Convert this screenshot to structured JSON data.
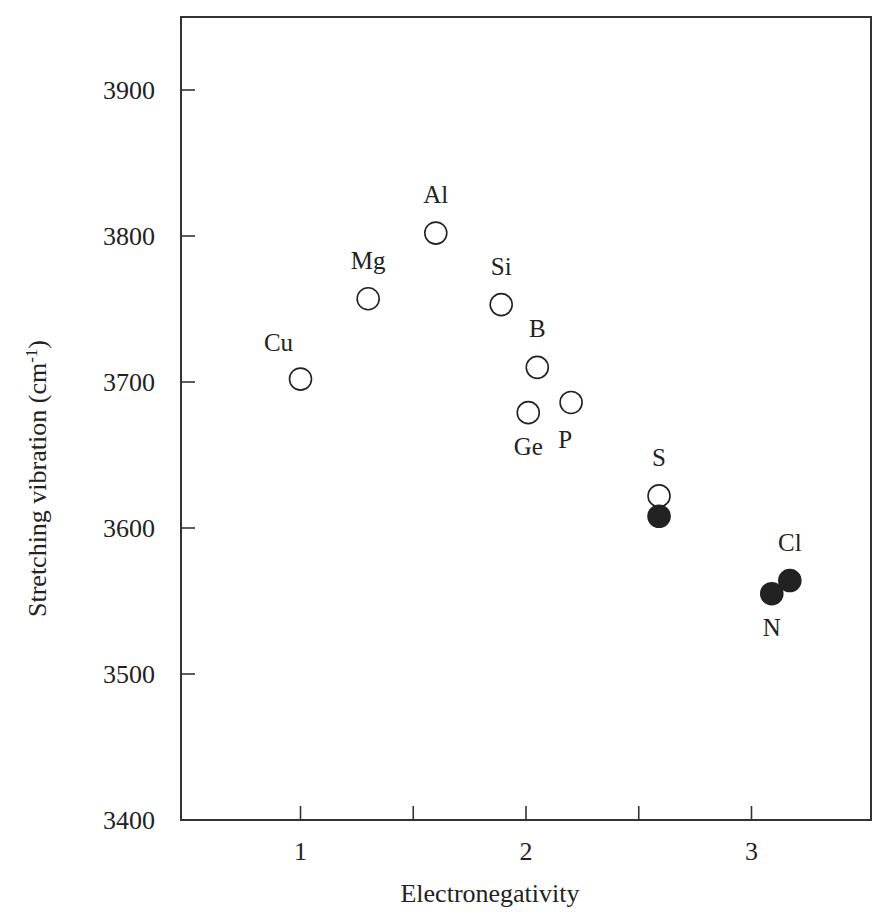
{
  "chart_data": {
    "type": "scatter",
    "title": "",
    "xlabel": "Electronegativity",
    "ylabel": "Stretching vibration (cm",
    "ylabel_superscript": "-1",
    "ylabel_suffix": ")",
    "xlim": [
      0.47,
      3.53
    ],
    "ylim": [
      3400,
      3950
    ],
    "x_ticks": [
      1,
      2,
      3
    ],
    "x_tick_labels": [
      "1",
      "2",
      "3"
    ],
    "x_minor_ticks": [
      1.5,
      2.5
    ],
    "y_ticks": [
      3400,
      3500,
      3600,
      3700,
      3800,
      3900
    ],
    "y_tick_labels": [
      "3400",
      "3500",
      "3600",
      "3700",
      "3800",
      "3900"
    ],
    "grid": false,
    "legend": null,
    "series": [
      {
        "name": "open",
        "marker": "open-circle",
        "points": [
          {
            "label": "Cu",
            "x": 1.0,
            "y": 3702,
            "label_pos": "above-left"
          },
          {
            "label": "Mg",
            "x": 1.3,
            "y": 3757,
            "label_pos": "above"
          },
          {
            "label": "Al",
            "x": 1.6,
            "y": 3802,
            "label_pos": "above"
          },
          {
            "label": "Si",
            "x": 1.89,
            "y": 3753,
            "label_pos": "above"
          },
          {
            "label": "B",
            "x": 2.05,
            "y": 3710,
            "label_pos": "above"
          },
          {
            "label": "Ge",
            "x": 2.01,
            "y": 3679,
            "label_pos": "below"
          },
          {
            "label": "P",
            "x": 2.2,
            "y": 3686,
            "label_pos": "below-left"
          },
          {
            "label": "S",
            "x": 2.59,
            "y": 3622,
            "label_pos": "above"
          }
        ]
      },
      {
        "name": "filled",
        "marker": "filled-circle",
        "points": [
          {
            "label": "",
            "x": 2.59,
            "y": 3608,
            "label_pos": "none"
          },
          {
            "label": "Cl",
            "x": 3.17,
            "y": 3564,
            "label_pos": "above"
          },
          {
            "label": "N",
            "x": 3.09,
            "y": 3555,
            "label_pos": "below"
          }
        ]
      }
    ],
    "colors": {
      "ink": "#222222",
      "frame": "#333333",
      "background": "#ffffff"
    }
  }
}
